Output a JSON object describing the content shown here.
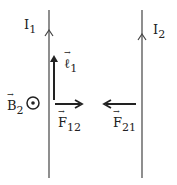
{
  "labels": {
    "I1": {
      "base": "I",
      "sub": "1"
    },
    "I2": {
      "base": "I",
      "sub": "2"
    },
    "l1": {
      "base": "ℓ",
      "sub": "1"
    },
    "B2": {
      "base": "B",
      "sub": "2"
    },
    "F12": {
      "base": "F",
      "sub": "12"
    },
    "F21": {
      "base": "F",
      "sub": "21"
    }
  },
  "symbols": {
    "field_out_of_page": "⊙"
  },
  "colors": {
    "line": "#333333",
    "background": "#ffffff"
  }
}
